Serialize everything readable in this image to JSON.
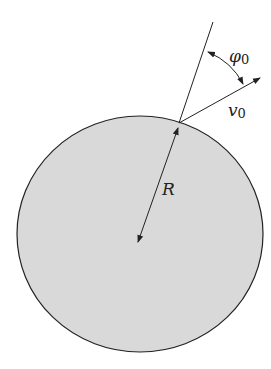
{
  "diagram": {
    "labels": {
      "angle": "φ",
      "angle_sub": "0",
      "velocity": "v",
      "velocity_sub": "0",
      "radius": "R"
    },
    "colors": {
      "fill": "#d9d9d9",
      "stroke": "#222222"
    }
  }
}
